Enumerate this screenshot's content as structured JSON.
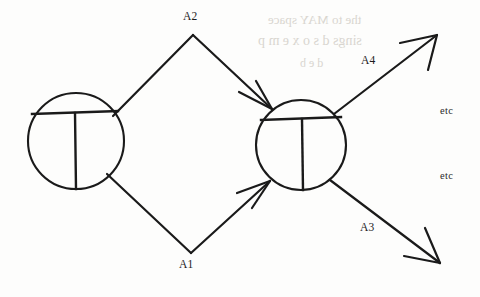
{
  "diagram": {
    "type": "node-and-arrow-diagram",
    "background_color": "#fdfdfc",
    "ink_color": "#1a1a1a",
    "nodes": [
      {
        "id": "left-node",
        "name": "left-circle-node",
        "cx": 76,
        "cy": 141,
        "r": 48,
        "glyph": "circle-with-t"
      },
      {
        "id": "right-node",
        "name": "right-circle-node",
        "cx": 301,
        "cy": 145,
        "r": 45,
        "glyph": "circle-with-t"
      }
    ],
    "edges": [
      {
        "id": "edge-a2-out",
        "label": "A2",
        "from": "left-node",
        "to": "apex-top",
        "arrow": false
      },
      {
        "id": "edge-a2-in",
        "label": "A2",
        "from": "apex-top",
        "to": "right-node",
        "arrow": true
      },
      {
        "id": "edge-a1-out",
        "label": "A1",
        "from": "left-node",
        "to": "apex-bottom",
        "arrow": false
      },
      {
        "id": "edge-a1-in",
        "label": "A1",
        "from": "apex-bottom",
        "to": "right-node",
        "arrow": true
      },
      {
        "id": "edge-a4",
        "label": "A4",
        "from": "right-node",
        "to": "outward-upper-right",
        "arrow": true
      },
      {
        "id": "edge-a3",
        "label": "A3",
        "from": "right-node",
        "to": "outward-lower-right",
        "arrow": true
      }
    ],
    "labels": {
      "a2": "A2",
      "a1": "A1",
      "a4": "A4",
      "a3": "A3",
      "etc_upper": "etc",
      "etc_lower": "etc"
    },
    "artifacts": {
      "bleed_line_1": "the to MAY space",
      "bleed_line_2": "sings d s o x e m p",
      "bleed_line_3": "d   e   b"
    }
  }
}
